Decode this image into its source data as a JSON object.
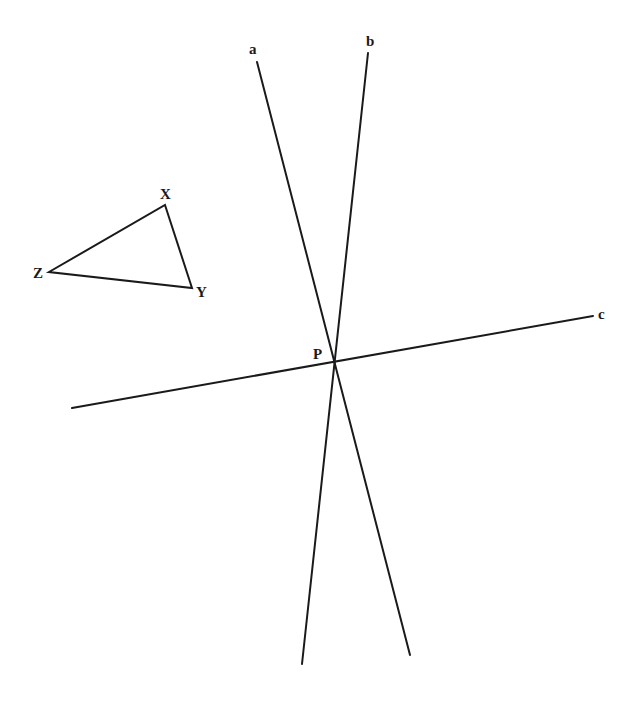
{
  "diagram": {
    "type": "geometry",
    "triangle": {
      "vertices": [
        {
          "name": "X",
          "x": 165,
          "y": 205,
          "label_x": 160,
          "label_y": 199
        },
        {
          "name": "Y",
          "x": 192,
          "y": 288,
          "label_x": 196,
          "label_y": 297
        },
        {
          "name": "Z",
          "x": 49,
          "y": 272,
          "label_x": 33,
          "label_y": 278
        }
      ]
    },
    "lines": [
      {
        "name": "a",
        "x1": 257,
        "y1": 62,
        "x2": 410,
        "y2": 655,
        "label_x": 249,
        "label_y": 54
      },
      {
        "name": "b",
        "x1": 368,
        "y1": 53,
        "x2": 302,
        "y2": 664,
        "label_x": 366,
        "label_y": 46
      },
      {
        "name": "c",
        "x1": 72,
        "y1": 408,
        "x2": 593,
        "y2": 316,
        "label_x": 598,
        "label_y": 319
      }
    ],
    "intersection": {
      "name": "P",
      "x": 333,
      "y": 362,
      "label_x": 313,
      "label_y": 359
    }
  },
  "labels": {
    "X": "X",
    "Y": "Y",
    "Z": "Z",
    "a": "a",
    "b": "b",
    "c": "c",
    "P": "P"
  },
  "colors": {
    "ink": "#1a1a1a",
    "background": "#ffffff"
  }
}
